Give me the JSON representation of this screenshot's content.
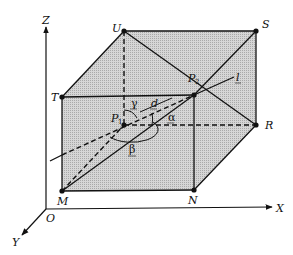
{
  "figure": {
    "type": "3D box geometry diagram",
    "axes": {
      "x_label": "X",
      "y_label": "Y",
      "z_label": "Z",
      "origin_label": "O"
    },
    "vertices": {
      "U": "U",
      "S": "S",
      "T": "T",
      "R": "R",
      "M": "M",
      "N": "N"
    },
    "points": {
      "p1_main": "P",
      "p1_sub": "1",
      "p2_main": "P",
      "p2_sub": "2"
    },
    "line_label": "l",
    "distance_label": "d",
    "angles": {
      "alpha": "α",
      "beta": "β",
      "gamma": "γ"
    },
    "colors": {
      "shade": "#c8c8c8",
      "line": "#111111",
      "background": "#ffffff"
    }
  }
}
